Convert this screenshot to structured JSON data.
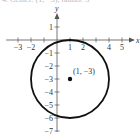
{
  "caption": "4. Center: (1, −3), radius: 3",
  "chart_data": {
    "type": "scatter",
    "title": "",
    "xlabel": "x",
    "ylabel": "y",
    "xlim": [
      -3,
      5
    ],
    "ylim": [
      -7,
      1
    ],
    "grid": false,
    "x_ticks": [
      -3,
      -2,
      -1,
      1,
      2,
      4,
      5
    ],
    "x_tick_labels": [
      "−3",
      "−2",
      "",
      "1",
      "2",
      "4",
      "5"
    ],
    "y_ticks": [
      1,
      -1,
      -2,
      -3,
      -4,
      -5,
      -6,
      -7
    ],
    "y_tick_labels": [
      "1",
      "−1",
      "−2",
      "−3",
      "−4",
      "−5",
      "−6",
      "−7"
    ],
    "shapes": [
      {
        "kind": "circle",
        "center": [
          1,
          -3
        ],
        "radius": 3
      }
    ],
    "points": [
      {
        "x": 1,
        "y": -3,
        "label": "(1, −3)"
      }
    ]
  },
  "colors": {
    "axis": "#555555",
    "circle": "#111111",
    "point": "#111111"
  }
}
